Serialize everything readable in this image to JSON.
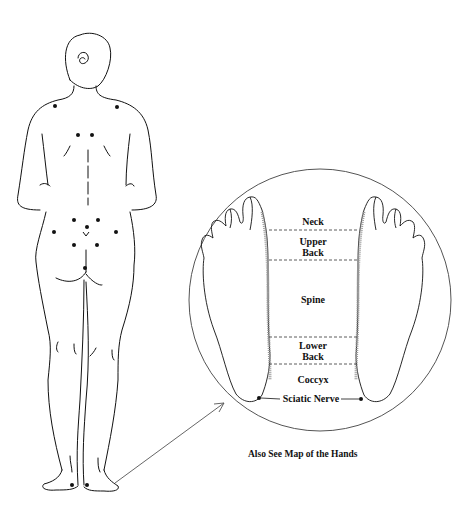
{
  "diagram": {
    "type": "reflexology-map",
    "labels": {
      "neck": "Neck",
      "upper_back_1": "Upper",
      "upper_back_2": "Back",
      "spine": "Spine",
      "lower_back_1": "Lower",
      "lower_back_2": "Back",
      "coccyx": "Coccyx",
      "sciatic_nerve": "Sciatic Nerve"
    },
    "caption": "Also See Map of the Hands",
    "colors": {
      "line": "#111111",
      "shading": "#999999",
      "circle": "#555555",
      "background": "#ffffff"
    },
    "body_points": 13
  }
}
